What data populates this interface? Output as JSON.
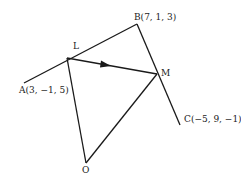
{
  "diagram": {
    "type": "vector-geometry",
    "points": {
      "A": {
        "label": "A(3, −1, 5)",
        "coords": [
          3,
          -1,
          5
        ]
      },
      "B": {
        "label": "B(7, 1, 3)",
        "coords": [
          7,
          1,
          3
        ]
      },
      "C": {
        "label": "C(−5, 9, −1)",
        "coords": [
          -5,
          9,
          -1
        ]
      },
      "L": {
        "label": "L"
      },
      "M": {
        "label": "M"
      },
      "O": {
        "label": "O"
      }
    },
    "segments": [
      {
        "from": "A",
        "to": "B",
        "note": "L lies on AB"
      },
      {
        "from": "B",
        "to": "C",
        "note": "M lies on BC"
      },
      {
        "from": "L",
        "to": "M",
        "note": "directed, arrow toward M"
      },
      {
        "from": "O",
        "to": "L"
      },
      {
        "from": "O",
        "to": "M"
      }
    ],
    "stroke_color": "#1a1a1a"
  }
}
